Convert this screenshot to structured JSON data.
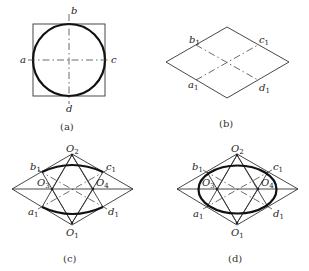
{
  "figure": {
    "panels": [
      {
        "id": "a",
        "caption": "(a)",
        "description": "Circle inscribed in square with center lines",
        "labels": {
          "top": "b",
          "left": "a",
          "right": "c",
          "bottom": "d"
        }
      },
      {
        "id": "b",
        "caption": "(b)",
        "description": "Isometric rhombus with conjugate diameters",
        "labels": {
          "b1": "b",
          "c1": "c",
          "a1": "a",
          "d1": "d",
          "subscript": "1"
        }
      },
      {
        "id": "c",
        "caption": "(c)",
        "description": "Four-center construction: upper and lower arcs drawn from O1 and O2",
        "labels": {
          "O1": "O",
          "O2": "O",
          "O3": "O",
          "O4": "O",
          "b1": "b",
          "c1": "c",
          "a1": "a",
          "d1": "d"
        },
        "subscripts": {
          "O1": "1",
          "O2": "2",
          "O3": "3",
          "O4": "4",
          "pt": "1"
        }
      },
      {
        "id": "d",
        "caption": "(d)",
        "description": "Completed approximate ellipse with side arcs from O3 and O4",
        "labels": {
          "O1": "O",
          "O2": "O",
          "O3": "O",
          "O4": "O",
          "b1": "b",
          "c1": "c",
          "a1": "a",
          "d1": "d"
        },
        "subscripts": {
          "O1": "1",
          "O2": "2",
          "O3": "3",
          "O4": "4",
          "pt": "1"
        }
      }
    ]
  }
}
